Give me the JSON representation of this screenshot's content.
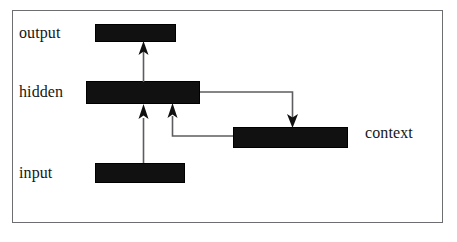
{
  "diagram": {
    "frame": {
      "border_color": "#6e6e72"
    },
    "node_color": "#111111",
    "edge_color": "#5d5d61",
    "layers": [
      {
        "id": "output",
        "label": "output"
      },
      {
        "id": "hidden",
        "label": "hidden"
      },
      {
        "id": "context",
        "label": "context"
      },
      {
        "id": "input",
        "label": "input"
      }
    ],
    "connections": [
      {
        "id": "hidden-to-output",
        "from": "hidden",
        "to": "output",
        "style": "straight-arrow",
        "direction": "up"
      },
      {
        "id": "input-to-hidden",
        "from": "input",
        "to": "hidden",
        "style": "straight-arrow",
        "direction": "up"
      },
      {
        "id": "hidden-to-context",
        "from": "hidden",
        "to": "context",
        "style": "elbow-arrow",
        "direction": "down"
      },
      {
        "id": "context-to-hidden",
        "from": "context",
        "to": "hidden",
        "style": "elbow-arrow",
        "direction": "up"
      }
    ]
  }
}
